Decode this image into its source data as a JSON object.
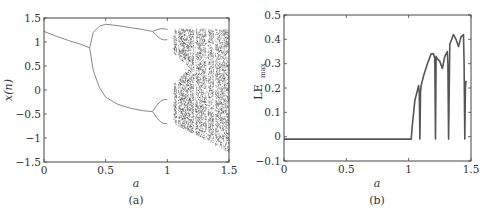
{
  "chart_data": [
    {
      "type": "scatter",
      "panel": "(a)",
      "title": "",
      "xlabel": "a",
      "ylabel": "x(n)",
      "xlim": [
        0,
        1.5
      ],
      "ylim": [
        -1.5,
        1.5
      ],
      "xticks": [
        "0",
        "0.5",
        "1",
        "1.5"
      ],
      "yticks": [
        "-1.5",
        "-1",
        "-0.5",
        "0",
        "0.5",
        "1",
        "1.5"
      ],
      "grid": false,
      "description": "Bifurcation diagram: single fixed point decreasing from 1.22 to 0.88 at a≈0.37, period-doubling into two branches (upper peaks ~1.37 at a≈0.5, lower falls to ~-0.45 at a≈0.88), further doublings near a≈0.9–1.0, chaotic region from a≈1.05 to 1.5 with periodic windows near a≈1.08, 1.22, 1.32",
      "series": [
        {
          "name": "fixed-point",
          "x": [
            0,
            0.1,
            0.2,
            0.3,
            0.37
          ],
          "y": [
            1.22,
            1.12,
            1.03,
            0.95,
            0.88
          ]
        },
        {
          "name": "upper-branch",
          "x": [
            0.37,
            0.4,
            0.45,
            0.5,
            0.6,
            0.7,
            0.8,
            0.88
          ],
          "y": [
            0.88,
            1.2,
            1.33,
            1.37,
            1.34,
            1.3,
            1.26,
            1.22
          ]
        },
        {
          "name": "lower-branch",
          "x": [
            0.37,
            0.4,
            0.45,
            0.5,
            0.6,
            0.7,
            0.8,
            0.88
          ],
          "y": [
            0.88,
            0.4,
            0.05,
            -0.15,
            -0.3,
            -0.38,
            -0.43,
            -0.45
          ]
        }
      ],
      "chaos_region": {
        "a_start": 1.05,
        "a_end": 1.5,
        "upper": 1.27,
        "lower_start": -0.7,
        "lower_end": -1.3,
        "windows": [
          1.08,
          1.22,
          1.32,
          1.38
        ]
      }
    },
    {
      "type": "line",
      "panel": "(b)",
      "title": "",
      "xlabel": "a",
      "ylabel": "LE_max",
      "xlim": [
        0,
        1.5
      ],
      "ylim": [
        -0.1,
        0.5
      ],
      "xticks": [
        "0",
        "0.5",
        "1",
        "1.5"
      ],
      "yticks": [
        "-0.1",
        "0",
        "0.1",
        "0.2",
        "0.3",
        "0.4",
        "0.5"
      ],
      "grid": false,
      "x": [
        0,
        0.5,
        1.0,
        1.02,
        1.03,
        1.05,
        1.07,
        1.08,
        1.085,
        1.09,
        1.095,
        1.1,
        1.12,
        1.15,
        1.18,
        1.2,
        1.21,
        1.215,
        1.22,
        1.23,
        1.25,
        1.27,
        1.29,
        1.31,
        1.315,
        1.32,
        1.33,
        1.36,
        1.38,
        1.4,
        1.42,
        1.44,
        1.445,
        1.45,
        1.455,
        1.46
      ],
      "y": [
        -0.01,
        -0.01,
        -0.01,
        -0.01,
        0.05,
        0.15,
        0.19,
        0.21,
        0.18,
        -0.01,
        0.18,
        0.21,
        0.25,
        0.3,
        0.34,
        0.34,
        0.32,
        -0.01,
        0.33,
        0.32,
        0.31,
        0.28,
        0.33,
        0.35,
        0.3,
        -0.01,
        0.38,
        0.42,
        0.4,
        0.37,
        0.41,
        0.42,
        0.3,
        -0.01,
        0.2,
        0.23
      ]
    }
  ],
  "labels": {
    "a_xlabel": "a",
    "a_ylabel": "x(n)",
    "a_panel": "(a)",
    "b_xlabel": "a",
    "b_ylabel_main": "LE",
    "b_ylabel_sub": "max",
    "b_panel": "(b)"
  }
}
